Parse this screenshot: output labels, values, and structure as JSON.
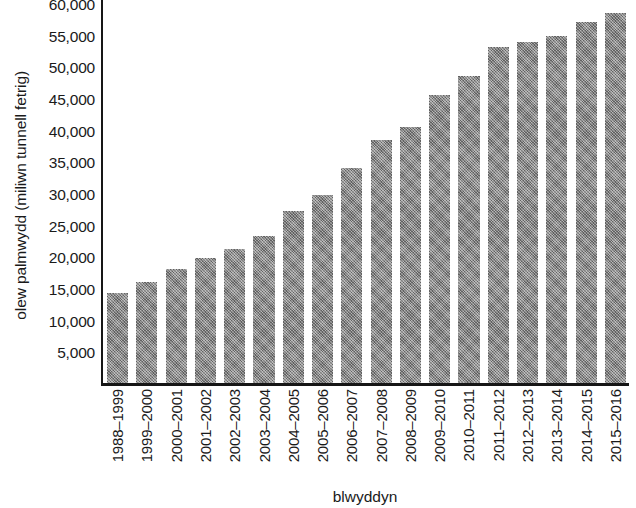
{
  "chart_data": {
    "type": "bar",
    "title": "",
    "subtitle": "",
    "xlabel": "blwyddyn",
    "ylabel": "olew palmwydd (miliwn tunnell fetrig)",
    "categories": [
      "1988–1999",
      "1999–2000",
      "2000–2001",
      "2001–2002",
      "2002–2003",
      "2003–2004",
      "2004–2005",
      "2005–2006",
      "2006–2007",
      "2007–2008",
      "2008–2009",
      "2009–2010",
      "2010–2011",
      "2011–2012",
      "2012–2013",
      "2013–2014",
      "2014–2015",
      "2015–2016"
    ],
    "values": [
      14200,
      16000,
      18000,
      19800,
      21200,
      23200,
      27100,
      29700,
      34000,
      38300,
      40500,
      45400,
      48500,
      53000,
      53800,
      54800,
      57000,
      58400
    ],
    "ylim": [
      0,
      60000
    ],
    "ytick_values": [
      5000,
      10000,
      15000,
      20000,
      25000,
      30000,
      35000,
      40000,
      45000,
      50000,
      55000,
      60000
    ],
    "ytick_labels": [
      "5,000",
      "10,000",
      "15,000",
      "20,000",
      "25,000",
      "30,000",
      "35,000",
      "40,000",
      "45,000",
      "50,000",
      "55,000",
      "60,000"
    ],
    "grid": false,
    "legend": "none",
    "bar_color": "#808080",
    "bar_texture": "cross-hatch-dither",
    "axis_color": "#161616",
    "background_color": "#ffffff",
    "series": [
      {
        "name": "olew palmwydd",
        "values": [
          14200,
          16000,
          18000,
          19800,
          21200,
          23200,
          27100,
          29700,
          34000,
          38300,
          40500,
          45400,
          48500,
          53000,
          53800,
          54800,
          57000,
          58400
        ]
      }
    ]
  }
}
